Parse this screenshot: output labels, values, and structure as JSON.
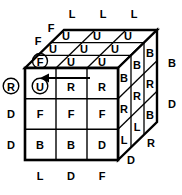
{
  "diagram": {
    "colors": {
      "stroke": "#000000",
      "fill": "#ffffff",
      "text": "#000000"
    },
    "front_face": {
      "name": "front-face",
      "rows": [
        [
          {
            "letter": "U",
            "circled": true
          },
          {
            "letter": "R",
            "circled": false
          },
          {
            "letter": "R",
            "circled": false
          }
        ],
        [
          {
            "letter": "F",
            "circled": false
          },
          {
            "letter": "F",
            "circled": false
          },
          {
            "letter": "F",
            "circled": false
          }
        ],
        [
          {
            "letter": "B",
            "circled": false
          },
          {
            "letter": "B",
            "circled": false
          },
          {
            "letter": "D",
            "circled": false
          }
        ]
      ]
    },
    "top_face": {
      "name": "top-face",
      "rows": [
        [
          {
            "letter": "U",
            "circled": false
          },
          {
            "letter": "U",
            "circled": false
          },
          {
            "letter": "U",
            "circled": false
          }
        ],
        [
          {
            "letter": "U",
            "circled": false
          },
          {
            "letter": "U",
            "circled": false
          },
          {
            "letter": "U",
            "circled": false
          }
        ],
        [
          {
            "letter": "F",
            "circled": true
          },
          {
            "letter": "U",
            "circled": false
          },
          {
            "letter": "U",
            "circled": false
          }
        ]
      ]
    },
    "right_face": {
      "name": "right-face",
      "rows": [
        [
          {
            "letter": "B",
            "circled": false
          },
          {
            "letter": "B",
            "circled": false
          },
          {
            "letter": "B",
            "circled": false
          }
        ],
        [
          {
            "letter": "R",
            "circled": false
          },
          {
            "letter": "R",
            "circled": false
          },
          {
            "letter": "R",
            "circled": false
          }
        ],
        [
          {
            "letter": "L",
            "circled": false
          },
          {
            "letter": "L",
            "circled": false
          },
          {
            "letter": "B",
            "circled": false
          }
        ]
      ]
    },
    "edge_labels": {
      "top": [
        "L",
        "L",
        "L"
      ],
      "upper_left": [
        "F",
        "F"
      ],
      "left": [
        "D",
        "D"
      ],
      "left_circled": "R",
      "bottom": [
        "L",
        "D",
        "F"
      ],
      "lower_right": [
        "D",
        "R"
      ],
      "far_right": [
        "B",
        "D"
      ]
    },
    "arrow": {
      "name": "move-arrow",
      "direction": "left",
      "row": "front-top-row"
    }
  }
}
